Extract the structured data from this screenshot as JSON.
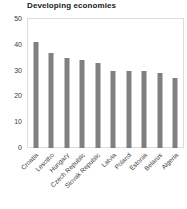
{
  "chart_data": {
    "type": "bar",
    "title": "Developing economies",
    "xlabel": "",
    "ylabel": "",
    "ylim": [
      0,
      50
    ],
    "yticks": [
      0,
      10,
      20,
      30,
      40,
      50
    ],
    "grid": false,
    "legend": false,
    "bar_color": "#808080",
    "categories": [
      "Croatia",
      "Lesotho",
      "Hungary",
      "Czech Republic",
      "Slovak Republic",
      "Latvia",
      "Poland",
      "Estonia",
      "Belarus",
      "Algeria"
    ],
    "values": [
      41,
      37,
      35,
      34,
      33,
      30,
      30,
      30,
      29,
      27
    ]
  }
}
